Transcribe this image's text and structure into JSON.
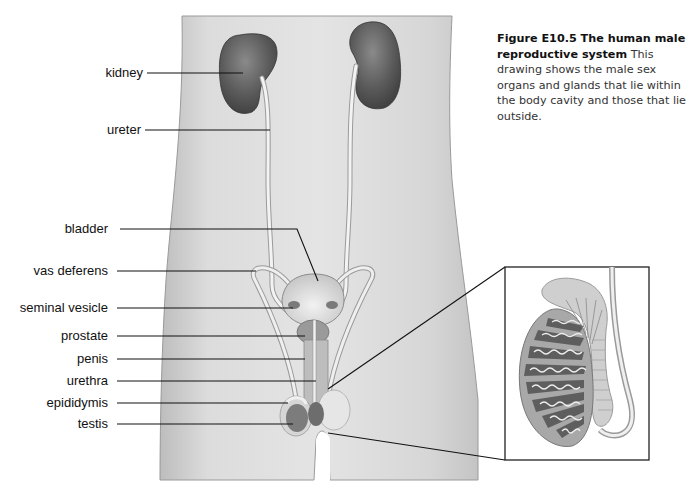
{
  "figure": {
    "caption_title": "Figure E10.5 The human male reproductive system",
    "caption_body": " This drawing shows the male sex organs and glands that lie within the body cavity and those that lie outside."
  },
  "labels": [
    {
      "id": "kidney",
      "text": "kidney"
    },
    {
      "id": "ureter",
      "text": "ureter"
    },
    {
      "id": "bladder",
      "text": "bladder"
    },
    {
      "id": "vas-deferens",
      "text": "vas deferens"
    },
    {
      "id": "seminal-vesicle",
      "text": "seminal vesicle"
    },
    {
      "id": "prostate",
      "text": "prostate"
    },
    {
      "id": "penis",
      "text": "penis"
    },
    {
      "id": "urethra",
      "text": "urethra"
    },
    {
      "id": "epididymis",
      "text": "epididymis"
    },
    {
      "id": "testis",
      "text": "testis"
    }
  ],
  "inset": {
    "subject": "testis-and-epididymis-cross-section"
  },
  "colors": {
    "skin": "#d9d9d9",
    "organ_dark": "#5a5a5a",
    "organ_mid": "#8c8c8c",
    "line": "#111111"
  }
}
